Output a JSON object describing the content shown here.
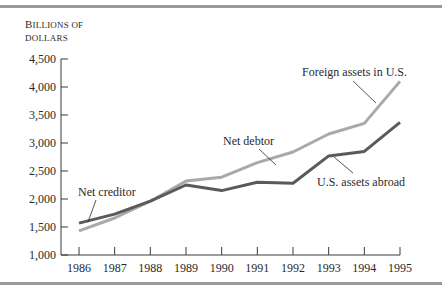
{
  "chart_data": {
    "type": "line",
    "title": "",
    "ylabel": "Billions of dollars",
    "ylabel_lines": [
      "BILLIONS OF",
      "DOLLARS"
    ],
    "xlabel": "",
    "x": [
      1986,
      1987,
      1988,
      1989,
      1990,
      1991,
      1992,
      1993,
      1994,
      1995
    ],
    "x_tick_labels": [
      "1986",
      "1987",
      "1988",
      "1989",
      "1990",
      "1991",
      "1992",
      "1993",
      "1994",
      "1995"
    ],
    "y_ticks": [
      1000,
      1500,
      2000,
      2500,
      3000,
      3500,
      4000,
      4500
    ],
    "y_tick_labels": [
      "1,000",
      "1,500",
      "2,000",
      "2,500",
      "3,000",
      "3,500",
      "4,000",
      "4,500"
    ],
    "ylim": [
      1000,
      4500
    ],
    "grid": false,
    "legend": "none (inline annotations)",
    "series": [
      {
        "name": "Foreign assets in U.S.",
        "color": "#a9a9a9",
        "values": [
          1430,
          1660,
          1960,
          2320,
          2390,
          2650,
          2840,
          3160,
          3350,
          4100
        ]
      },
      {
        "name": "U.S. assets abroad",
        "color": "#5a5a5a",
        "values": [
          1570,
          1730,
          1960,
          2250,
          2150,
          2300,
          2280,
          2770,
          2850,
          3370
        ]
      }
    ],
    "annotations": [
      {
        "text": "Net creditor",
        "x": 1986.3
      },
      {
        "text": "Net debtor",
        "x": 1991.5
      },
      {
        "text": "Foreign assets in U.S.",
        "x": 1994.5
      },
      {
        "text": "U.S. assets abroad",
        "x": 1993.7
      }
    ]
  },
  "labels": {
    "ylabel_line1_cap": "B",
    "ylabel_line1_rest": "ILLIONS OF",
    "ylabel_line2": "DOLLARS",
    "net_creditor": "Net creditor",
    "net_debtor": "Net debtor",
    "foreign_assets": "Foreign assets in U.S.",
    "us_assets": "U.S. assets abroad"
  }
}
